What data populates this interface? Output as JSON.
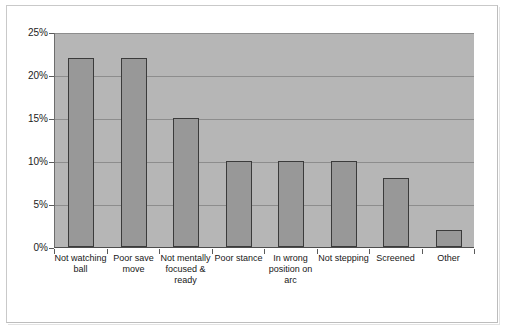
{
  "chart_data": {
    "type": "bar",
    "title": "",
    "subtitle": "",
    "xlabel": "",
    "ylabel": "",
    "ylim": [
      0,
      25
    ],
    "ytick_values": [
      0,
      5,
      10,
      15,
      20,
      25
    ],
    "ytick_labels": [
      "0%",
      "5%",
      "10%",
      "15%",
      "20%",
      "25%"
    ],
    "grid": true,
    "legend": "none",
    "categories": [
      "Not watching ball",
      "Poor save move",
      "Not mentally focused & ready",
      "Poor stance",
      "In wrong position on arc",
      "Not stepping",
      "Screened",
      "Other"
    ],
    "values": [
      22,
      22,
      15,
      10,
      10,
      10,
      8,
      2
    ],
    "value_unit": "%",
    "colors": {
      "bar_fill": "#989898",
      "bar_edge": "#3b3b3b",
      "plot_background": "#b6b6b6",
      "gridline": "#8d8d8d",
      "figure_background": "#ffffff",
      "axis": "#5a5a5a",
      "text": "#171717"
    }
  }
}
